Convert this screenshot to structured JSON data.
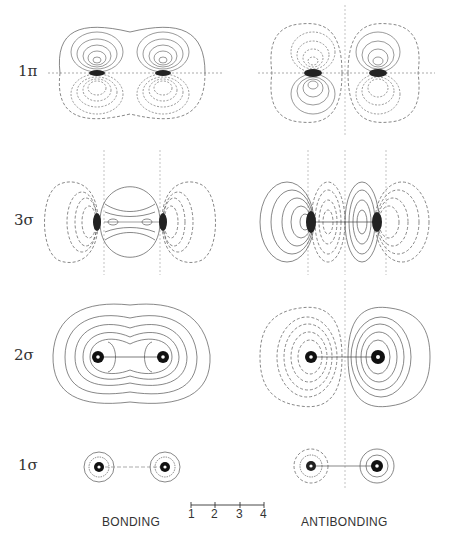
{
  "figure": {
    "type": "molecular-orbital-contour-diagram",
    "rows": [
      {
        "id": "1pi",
        "label": "1π",
        "cy": 73
      },
      {
        "id": "3sigma",
        "label": "3σ",
        "cy": 222
      },
      {
        "id": "2sigma",
        "label": "2σ",
        "cy": 357
      },
      {
        "id": "1sigma",
        "label": "1σ",
        "cy": 467
      }
    ],
    "columns": [
      {
        "id": "bonding",
        "label": "BONDING"
      },
      {
        "id": "antibonding",
        "label": "ANTIBONDING"
      }
    ],
    "scale_bar": {
      "ticks": [
        "1",
        "2",
        "3",
        "4"
      ]
    },
    "colors": {
      "contour": "#555555",
      "nucleus": "#111111",
      "background": "#ffffff"
    }
  }
}
